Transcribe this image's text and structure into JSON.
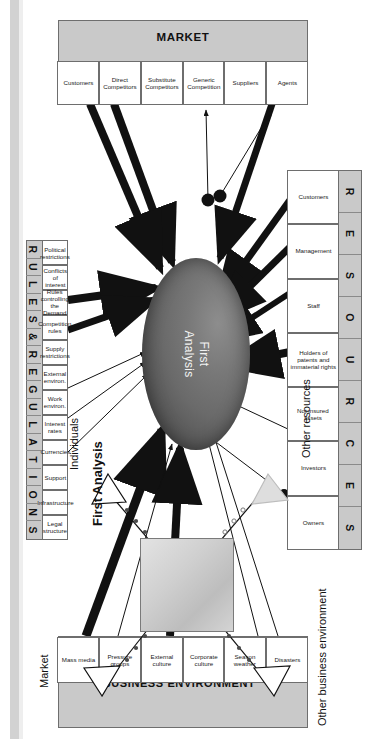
{
  "page": {
    "faint_header": "",
    "background": "#ffffff"
  },
  "diagram": {
    "title": "First Analysis",
    "center_node": {
      "label_line1": "First",
      "label_line2": "Analysis",
      "shape": "ellipse",
      "fill": "#6a6a6a"
    },
    "groups": [
      {
        "id": "resources",
        "title": "RESOURCES",
        "letters": [
          "R",
          "E",
          "S",
          "O",
          "U",
          "R",
          "C",
          "E",
          "S"
        ],
        "items": [
          "Customers",
          "Management",
          "Staff",
          "Holders of patents and immaterial rights",
          "Not insured assets",
          "Investors",
          "Owners"
        ]
      },
      {
        "id": "market",
        "title": "MARKET",
        "letters": [],
        "items": [
          "Customers",
          "Direct Competitors",
          "Substitute Competitors",
          "Generic Competition",
          "Suppliers",
          "Agents"
        ]
      },
      {
        "id": "rules",
        "title": "RULES & REGULATIONS",
        "letters": [
          "R",
          "U",
          "L",
          "E",
          "S",
          "&",
          "R",
          "E",
          "G",
          "U",
          "L",
          "A",
          "T",
          "I",
          "O",
          "N",
          "S"
        ],
        "items": [
          "Political restrictions",
          "Conflicts of interest",
          "Rules controlling the Demand",
          "Competition rules",
          "Supply restrictions",
          "External environ.",
          "Work environ.",
          "Interest rates",
          "Currencies",
          "Support",
          "Infrastructure",
          "Legal structure"
        ]
      },
      {
        "id": "business_environment",
        "title": "BUSINESS ENVIRONMENT",
        "letters": [],
        "items": [
          "Mass media",
          "Pressure groups",
          "External culture",
          "Corporate culture",
          "Season weather",
          "Disasters"
        ]
      }
    ]
  },
  "radar": {
    "title": "First Analysis",
    "axes": [
      {
        "id": "individuals",
        "label": "Individuals"
      },
      {
        "id": "other_resources",
        "label": "Other resources"
      },
      {
        "id": "market",
        "label": "Market"
      },
      {
        "id": "other_business_environment",
        "label": "Other business environment"
      }
    ]
  },
  "colors": {
    "band": "#c9c9c9",
    "cell": "#ffffff",
    "stroke": "#6e6e6e",
    "node": "#6a6a6a",
    "arrow": "#111111"
  }
}
